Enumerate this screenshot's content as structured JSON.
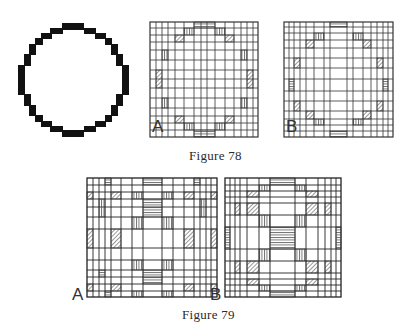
{
  "figures": [
    {
      "caption": "Figure 78",
      "panels": [
        {
          "id": "circle",
          "label": "",
          "description": "pixelated circle outline"
        },
        {
          "id": "78A",
          "label": "A",
          "description": "grid decomposition of circle with hatched boundary cells"
        },
        {
          "id": "78B",
          "label": "B",
          "description": "alternate grid decomposition of circle with hatched boundary cells"
        }
      ]
    },
    {
      "caption": "Figure 79",
      "panels": [
        {
          "id": "79A",
          "label": "A",
          "description": "grid pattern with hatched blocks"
        },
        {
          "id": "79B",
          "label": "B",
          "description": "alternate grid pattern with hatched blocks"
        }
      ]
    }
  ],
  "labels": {
    "fig78_caption": "Figure 78",
    "fig79_caption": "Figure 79",
    "fig78a_letter": "A",
    "fig78b_letter": "B",
    "fig79a_letter": "A",
    "fig79b_letter": "B"
  }
}
